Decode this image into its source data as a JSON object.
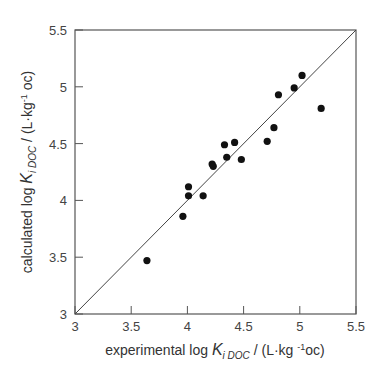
{
  "chart_data": {
    "type": "scatter",
    "title": "",
    "xlabel": "experimental log K_iDOC / (L·kg -1 oc)",
    "ylabel": "calculated log K_iDOC / (L·kg-1 oc)",
    "xlabel_parts": {
      "pre": "experimental log ",
      "var": "K",
      "sub": "i DOC",
      "post": " / (L·kg ",
      "sup": "-1",
      "post2": "oc)"
    },
    "ylabel_parts": {
      "pre": "calculated log ",
      "var": "K",
      "sub": "i DOC",
      "post": " / (L·kg",
      "sup": "-1",
      "post2": " oc)"
    },
    "xlim": [
      3,
      5.5
    ],
    "ylim": [
      3,
      5.5
    ],
    "xticks": [
      "3",
      "3.5",
      "4",
      "4.5",
      "5",
      "5.5"
    ],
    "yticks": [
      "3",
      "3.5",
      "4",
      "4.5",
      "5",
      "5.5"
    ],
    "grid": false,
    "legend": null,
    "reference_line": {
      "type": "1:1",
      "from": [
        3,
        3
      ],
      "to": [
        5.5,
        5.5
      ]
    },
    "series": [
      {
        "name": "compounds",
        "marker": "filled-circle",
        "color": "#111111",
        "points": [
          [
            3.64,
            3.47
          ],
          [
            3.96,
            3.86
          ],
          [
            4.01,
            4.12
          ],
          [
            4.01,
            4.04
          ],
          [
            4.14,
            4.04
          ],
          [
            4.22,
            4.32
          ],
          [
            4.23,
            4.3
          ],
          [
            4.33,
            4.49
          ],
          [
            4.35,
            4.38
          ],
          [
            4.42,
            4.51
          ],
          [
            4.48,
            4.36
          ],
          [
            4.71,
            4.52
          ],
          [
            4.77,
            4.64
          ],
          [
            4.81,
            4.93
          ],
          [
            4.95,
            4.99
          ],
          [
            5.02,
            5.1
          ],
          [
            5.19,
            4.81
          ]
        ]
      }
    ]
  }
}
